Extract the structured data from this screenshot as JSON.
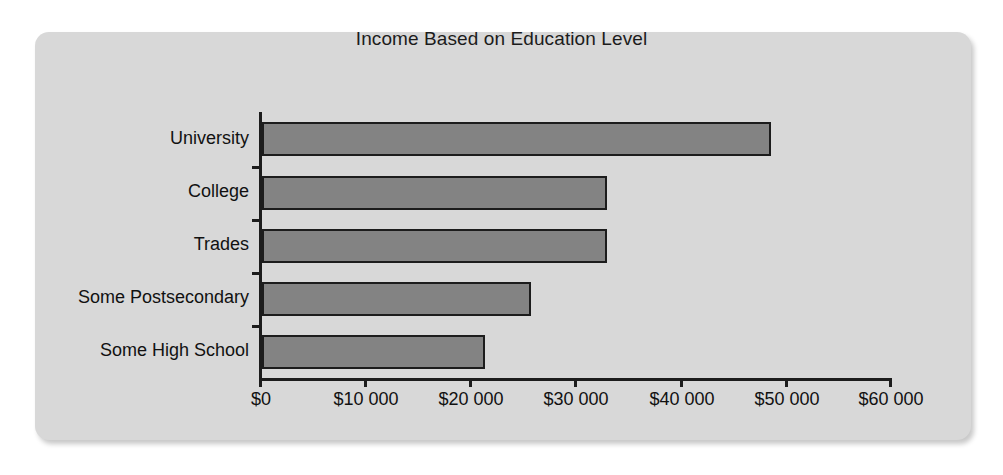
{
  "chart_data": {
    "type": "bar",
    "orientation": "horizontal",
    "title": "Income Based on Education Level",
    "xlabel": "",
    "ylabel": "",
    "categories": [
      "University",
      "College",
      "Trades",
      "Some Postsecondary",
      "Some High School"
    ],
    "values": [
      48600,
      33000,
      33000,
      25700,
      21300
    ],
    "xlim": [
      0,
      60000
    ],
    "xticks": [
      0,
      10000,
      20000,
      30000,
      40000,
      50000,
      60000
    ],
    "xtick_labels": [
      "$0",
      "$10 000",
      "$20 000",
      "$30 000",
      "$40 000",
      "$50 000",
      "$60 000"
    ],
    "grid": false,
    "legend": false,
    "bar_color": "#838383",
    "bar_edge_color": "#1c1c1c",
    "panel_color": "#d8d8d8",
    "page_color": "#ffffff"
  },
  "axis": {
    "x_tick_0": "$0",
    "x_tick_1": "$10 000",
    "x_tick_2": "$20 000",
    "x_tick_3": "$30 000",
    "x_tick_4": "$40 000",
    "x_tick_5": "$50 000",
    "x_tick_6": "$60 000"
  },
  "categories": {
    "cat_0": "University",
    "cat_1": "College",
    "cat_2": "Trades",
    "cat_3": "Some Postsecondary",
    "cat_4": "Some High School"
  }
}
